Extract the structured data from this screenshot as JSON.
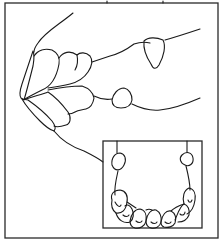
{
  "figure": {
    "caption_partial": "",
    "colors": {
      "stroke": "#1a1a1a",
      "background": "#ffffff"
    },
    "main_view": {
      "label": "lateral-jaw-view"
    },
    "inset": {
      "label": "occlusal-arch-view",
      "tooth_count_visible": 8
    }
  }
}
